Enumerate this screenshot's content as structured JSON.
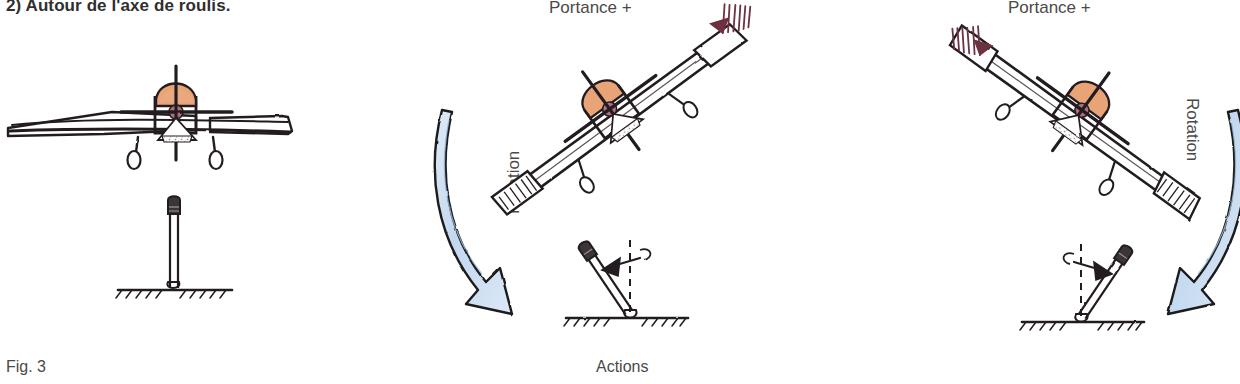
{
  "figure": {
    "heading": "2) Autour de l'axe de roulis.",
    "fig_caption": "Fig. 3",
    "actions_caption": "Actions",
    "lift_label_left": "Portance +",
    "lift_label_right": "Portance +",
    "rotation_label_left": "Rotation",
    "rotation_label_right": "Rotation",
    "colors": {
      "ink": "#231f20",
      "canopy": "#e8a477",
      "cowl_pink": "#b07080",
      "rotation_arrow_fill": "#cfe0f2",
      "rotation_arrow_stroke": "#1a1a1a",
      "lift_scribble": "#6d3040",
      "text": "#4a4a4a"
    },
    "panels": [
      {
        "name": "level-flight",
        "aircraft_bank_deg": 0,
        "stick_deflection": "neutral",
        "stick_angle_deg": 0
      },
      {
        "name": "roll-right",
        "aircraft_bank_deg": -35,
        "stick_deflection": "left",
        "stick_angle_deg": -35,
        "lift_side": "right-wingtip",
        "rotation_direction": "clockwise-down-right"
      },
      {
        "name": "roll-left",
        "aircraft_bank_deg": 35,
        "stick_deflection": "right",
        "stick_angle_deg": 35,
        "lift_side": "left-wingtip",
        "rotation_direction": "counterclockwise-down-left"
      }
    ]
  }
}
